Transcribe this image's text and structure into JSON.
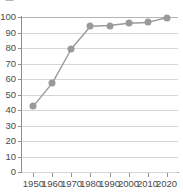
{
  "top_fragment": "· ▬ · · · · ·",
  "chart_data": {
    "type": "line",
    "title": "",
    "subtitle": "",
    "xlabel": "",
    "ylabel": "",
    "x": [
      1950,
      1960,
      1970,
      1980,
      1990,
      2000,
      2010,
      2020
    ],
    "categories": [
      "1950",
      "1960",
      "1970",
      "1980",
      "1990",
      "2000",
      "2010",
      "2020"
    ],
    "values": [
      42.5,
      57.5,
      79.5,
      94.0,
      94.5,
      96.0,
      96.5,
      99.5
    ],
    "series": [
      {
        "name": "",
        "values": [
          42.5,
          57.5,
          79.5,
          94.0,
          94.5,
          96.0,
          96.5,
          99.5
        ]
      }
    ],
    "xlim": [
      1944,
      2026
    ],
    "ylim": [
      0,
      100
    ],
    "ytick_labels": [
      "0",
      "10",
      "20",
      "30",
      "40",
      "50",
      "60",
      "70",
      "80",
      "90",
      "100"
    ],
    "ytick_values": [
      0,
      10,
      20,
      30,
      40,
      50,
      60,
      70,
      80,
      90,
      100
    ],
    "xtick_labels": [
      "1950",
      "1960",
      "1970",
      "1980",
      "1990",
      "2000",
      "2010",
      "2020"
    ],
    "xtick_values": [
      1950,
      1960,
      1970,
      1980,
      1990,
      2000,
      2010,
      2020
    ],
    "grid": "horizontal",
    "legend": "none",
    "colors": {
      "line": "#9a9a9a",
      "marker": "#9a9a9a",
      "grid": "#d6d6d6",
      "axis": "#8f8f8f",
      "tick_label": "#4a4a4a",
      "background": "#ffffff"
    },
    "marker": "circle",
    "marker_size": 7,
    "line_width": 1.4
  }
}
